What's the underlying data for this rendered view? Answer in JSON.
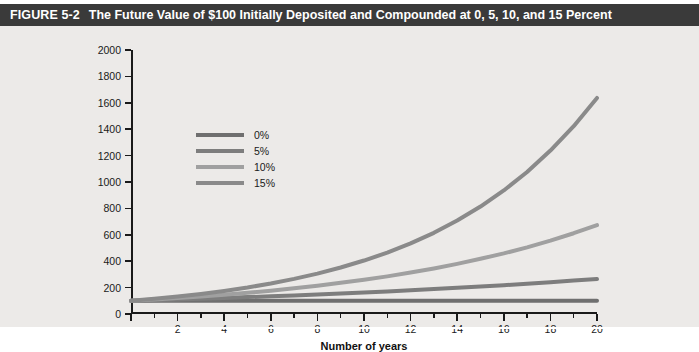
{
  "figure": {
    "number_label": "FIGURE 5-2",
    "title": "The Future Value of $100 Initially Deposited and Compounded at 0, 5, 10, and 15 Percent",
    "titlebar_color": "#3a3a3a",
    "panel_color": "#eceae8"
  },
  "legend": {
    "position": "inside-upper-left",
    "items": [
      {
        "label": "0%",
        "color": "#6f6f6f"
      },
      {
        "label": "5%",
        "color": "#7d7d7d"
      },
      {
        "label": "10%",
        "color": "#a0a0a0"
      },
      {
        "label": "15%",
        "color": "#8a8a8a"
      }
    ]
  },
  "chart_data": {
    "type": "line",
    "title": "The Future Value of $100 Initially Deposited and Compounded at 0, 5, 10, and 15 Percent",
    "xlabel": "Number of years",
    "ylabel": "Future value (dollars)",
    "xlim": [
      0,
      20
    ],
    "ylim": [
      0,
      2000
    ],
    "xticks": [
      0,
      2,
      4,
      6,
      8,
      10,
      12,
      14,
      16,
      18,
      20
    ],
    "xtick_labels": [
      "",
      "2",
      "4",
      "6",
      "8",
      "10",
      "12",
      "14",
      "16",
      "18",
      "20"
    ],
    "x_minor_ticks": [
      1,
      3,
      5,
      7,
      9,
      11,
      13,
      15,
      17,
      19
    ],
    "yticks": [
      0,
      200,
      400,
      600,
      800,
      1000,
      1200,
      1400,
      1600,
      1800,
      2000
    ],
    "ytick_labels": [
      "0",
      "200",
      "400",
      "600",
      "800",
      "1000",
      "1200",
      "1400",
      "1600",
      "1800",
      "2000"
    ],
    "grid": false,
    "x": [
      0,
      1,
      2,
      3,
      4,
      5,
      6,
      7,
      8,
      9,
      10,
      11,
      12,
      13,
      14,
      15,
      16,
      17,
      18,
      19,
      20
    ],
    "series": [
      {
        "name": "0%",
        "color": "#6f6f6f",
        "values": [
          100,
          100,
          100,
          100,
          100,
          100,
          100,
          100,
          100,
          100,
          100,
          100,
          100,
          100,
          100,
          100,
          100,
          100,
          100,
          100,
          100
        ]
      },
      {
        "name": "5%",
        "color": "#7d7d7d",
        "values": [
          100,
          105,
          110,
          116,
          122,
          128,
          134,
          141,
          148,
          155,
          163,
          171,
          180,
          189,
          198,
          208,
          218,
          229,
          241,
          253,
          265
        ]
      },
      {
        "name": "10%",
        "color": "#a0a0a0",
        "values": [
          100,
          110,
          121,
          133,
          146,
          161,
          177,
          195,
          214,
          236,
          259,
          285,
          314,
          345,
          380,
          418,
          459,
          505,
          556,
          612,
          673
        ]
      },
      {
        "name": "15%",
        "color": "#8a8a8a",
        "values": [
          100,
          115,
          132,
          152,
          175,
          201,
          231,
          266,
          306,
          352,
          405,
          465,
          535,
          615,
          708,
          814,
          936,
          1076,
          1238,
          1423,
          1637
        ]
      }
    ]
  }
}
